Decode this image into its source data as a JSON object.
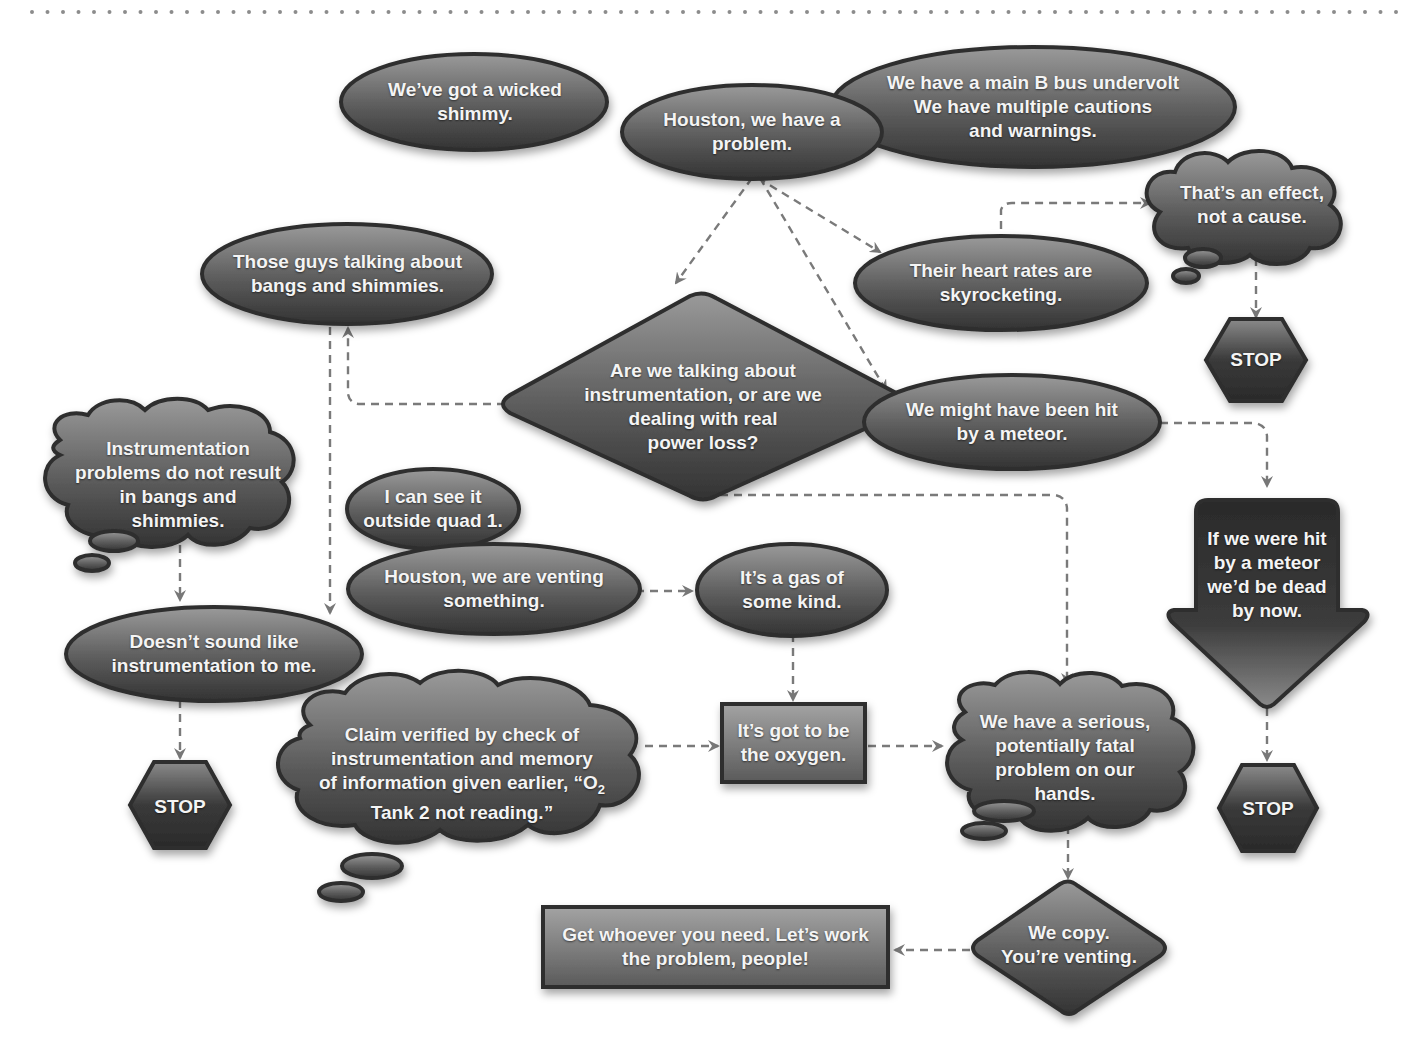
{
  "diagram": {
    "colors": {
      "background": "#ffffff",
      "node_fill_light": "#8a8a8a",
      "node_fill_dark": "#3a3a3a",
      "node_border": "#2e2e2e",
      "node_text": "#f4f4f4",
      "connector": "#7a7a7a",
      "top_border_dots": "#8c8c8c"
    },
    "nodes": {
      "wicked_shimmy": {
        "shape": "ellipse",
        "text": "We’ve got a wicked\nshimmy."
      },
      "houston_problem": {
        "shape": "ellipse",
        "text": "Houston, we have a\nproblem."
      },
      "main_b_bus": {
        "shape": "ellipse",
        "text": "We have a main B bus undervolt\nWe have multiple cautions\nand warnings."
      },
      "effect_not_cause": {
        "shape": "cloud",
        "text": "That’s an effect,\nnot a cause."
      },
      "stop_top_right": {
        "shape": "hexagon",
        "text": "STOP"
      },
      "bangs_shimmies": {
        "shape": "ellipse",
        "text": "Those guys talking about\nbangs and shimmies."
      },
      "heart_rates": {
        "shape": "ellipse",
        "text": "Their heart rates are\nskyrocketing."
      },
      "instrumentation_question": {
        "shape": "diamond",
        "text": "Are we talking about\ninstrumentation, or are we\ndealing with real\npower loss?"
      },
      "meteor_hit": {
        "shape": "ellipse",
        "text": "We might have been hit\nby a meteor."
      },
      "instrumentation_problems": {
        "shape": "cloud",
        "text": "Instrumentation\nproblems do not result\nin bangs and\nshimmies."
      },
      "see_outside_quad": {
        "shape": "ellipse",
        "text": "I can see it\noutside quad 1."
      },
      "venting_something": {
        "shape": "ellipse",
        "text": "Houston, we are venting\nsomething."
      },
      "gas_of_some_kind": {
        "shape": "ellipse",
        "text": "It’s a gas of\nsome kind."
      },
      "meteor_dead": {
        "shape": "arrow-down",
        "text": "If we were hit\nby a meteor\nwe’d be dead\nby now."
      },
      "not_instrumentation": {
        "shape": "ellipse",
        "text": "Doesn’t sound like\ninstrumentation to me."
      },
      "claim_verified": {
        "shape": "cloud",
        "text_line1": "Claim verified by check of",
        "text_line2": "instrumentation and memory",
        "text_line3_pre": "of information given earlier, “O",
        "text_line3_sub": "2",
        "text_line4": "Tank 2 not reading.”"
      },
      "got_to_be_oxygen": {
        "shape": "rectangle",
        "text": "It’s got to be\nthe oxygen."
      },
      "serious_problem": {
        "shape": "cloud",
        "text": "We have a serious,\npotentially fatal\nproblem on our\nhands."
      },
      "stop_left": {
        "shape": "hexagon",
        "text": "STOP"
      },
      "stop_right": {
        "shape": "hexagon",
        "text": "STOP"
      },
      "we_copy": {
        "shape": "diamond",
        "text": "We copy.\nYou’re venting."
      },
      "work_the_problem": {
        "shape": "rectangle",
        "text": "Get whoever you need. Let’s work\nthe problem, people!"
      }
    },
    "edges": [
      {
        "from": "houston_problem",
        "to": "instrumentation_question",
        "style": "dashed"
      },
      {
        "from": "houston_problem",
        "to": "heart_rates",
        "style": "dashed"
      },
      {
        "from": "houston_problem",
        "to": "meteor_hit",
        "style": "dashed"
      },
      {
        "from": "heart_rates",
        "to": "effect_not_cause",
        "style": "dashed"
      },
      {
        "from": "effect_not_cause",
        "to": "stop_top_right",
        "style": "dashed"
      },
      {
        "from": "instrumentation_question",
        "to": "bangs_shimmies",
        "style": "dashed"
      },
      {
        "from": "bangs_shimmies",
        "to": "not_instrumentation",
        "style": "dashed"
      },
      {
        "from": "instrumentation_problems",
        "to": "not_instrumentation",
        "style": "dashed"
      },
      {
        "from": "not_instrumentation",
        "to": "stop_left",
        "style": "dashed"
      },
      {
        "from": "instrumentation_question",
        "to": "serious_problem",
        "style": "dashed"
      },
      {
        "from": "meteor_hit",
        "to": "meteor_dead",
        "style": "dashed"
      },
      {
        "from": "meteor_dead",
        "to": "stop_right",
        "style": "dashed"
      },
      {
        "from": "venting_something",
        "to": "gas_of_some_kind",
        "style": "dashed"
      },
      {
        "from": "gas_of_some_kind",
        "to": "got_to_be_oxygen",
        "style": "dashed"
      },
      {
        "from": "claim_verified",
        "to": "got_to_be_oxygen",
        "style": "dashed"
      },
      {
        "from": "got_to_be_oxygen",
        "to": "serious_problem",
        "style": "dashed"
      },
      {
        "from": "serious_problem",
        "to": "we_copy",
        "style": "dashed"
      },
      {
        "from": "we_copy",
        "to": "work_the_problem",
        "style": "dashed"
      }
    ]
  }
}
